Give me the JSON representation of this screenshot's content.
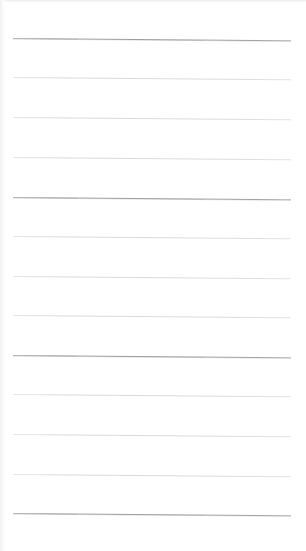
{
  "page": {
    "type": "blank ruled notebook page",
    "background_color": "#ffffff",
    "rule_left_x": 13,
    "rule_right_x": 291,
    "rules": [
      {
        "y": 38,
        "weight": "heavy",
        "color": "#9a9a9a"
      },
      {
        "y": 77,
        "weight": "light",
        "color": "#dadada"
      },
      {
        "y": 117,
        "weight": "light",
        "color": "#dadada"
      },
      {
        "y": 157,
        "weight": "light",
        "color": "#dadada"
      },
      {
        "y": 197,
        "weight": "heavy",
        "color": "#9a9a9a"
      },
      {
        "y": 236,
        "weight": "light",
        "color": "#dadada"
      },
      {
        "y": 276,
        "weight": "light",
        "color": "#dadada"
      },
      {
        "y": 315,
        "weight": "light",
        "color": "#dadada"
      },
      {
        "y": 355,
        "weight": "heavy",
        "color": "#9a9a9a"
      },
      {
        "y": 394,
        "weight": "light",
        "color": "#dadada"
      },
      {
        "y": 434,
        "weight": "light",
        "color": "#dadada"
      },
      {
        "y": 474,
        "weight": "light",
        "color": "#dadada"
      },
      {
        "y": 513,
        "weight": "heavy",
        "color": "#9a9a9a"
      }
    ],
    "text_content": []
  }
}
